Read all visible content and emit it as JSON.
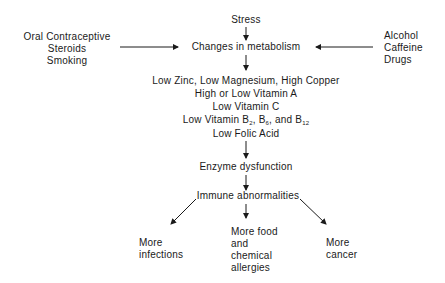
{
  "diagram": {
    "top_node": "Stress",
    "central_node": "Changes in metabolism",
    "left_inputs": [
      "Oral Contraceptive",
      "Steroids",
      "Smoking"
    ],
    "right_inputs": [
      "Alcohol",
      "Caffeine",
      "Drugs"
    ],
    "nutrient_changes": {
      "line1": "Low Zinc, Low Magnesium, High Copper",
      "line2": "High or Low Vitamin A",
      "line3": "Low Vitamin C",
      "line4_prefix": "Low Vitamin B",
      "line4_sub1": "2",
      "line4_mid1": ", B",
      "line4_sub2": "6",
      "line4_mid2": ", and B",
      "line4_sub3": "12",
      "line5": "Low Folic Acid"
    },
    "enzyme_node": "Enzyme dysfunction",
    "immune_node": "Immune abnormalities",
    "outcomes": {
      "left": [
        "More",
        "infections"
      ],
      "center": [
        "More food",
        "and",
        "chemical",
        "allergies"
      ],
      "right": [
        "More",
        "cancer"
      ]
    },
    "colors": {
      "text": "#1a1a1a",
      "arrow": "#1a1a1a",
      "background": "#ffffff"
    }
  }
}
